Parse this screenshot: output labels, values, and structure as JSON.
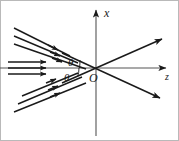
{
  "figure": {
    "kind": "optics-ray-diagram",
    "width": 179,
    "height": 141,
    "background_color": "#ffffff",
    "border_color": "#b9b9b9",
    "stroke_color": "#1a1a1a"
  },
  "axes": {
    "vertical": {
      "label": "x",
      "label_style": "italic",
      "direction": "up",
      "arrowhead": true,
      "x": 96,
      "y_top": 8,
      "y_bottom": 136
    },
    "horizontal": {
      "label": "z",
      "label_style": "italic",
      "direction": "right",
      "arrowhead": true,
      "y": 68,
      "x_left": 0,
      "x_right": 168
    },
    "origin": {
      "label": "O",
      "label_style": "italic",
      "x": 96,
      "y": 68
    }
  },
  "angles": [
    {
      "label": "θ",
      "name": "angle-of-incidence",
      "position": "above-axis-left-of-origin",
      "label_x": 68,
      "label_y": 65,
      "arc_from": "incident-ray-upper",
      "arc_to": "horizontal-axis"
    },
    {
      "label": "θ",
      "name": "angle-of-reflection",
      "position": "below-axis-left-of-origin",
      "label_x": 64,
      "label_y": 80,
      "arc_from": "horizontal-axis",
      "arc_to": "incident-ray-lower"
    }
  ],
  "ray_bundles": [
    {
      "name": "upper-left-incident-beam",
      "label": "",
      "direction": "down-right",
      "angle_deg": 27,
      "count": 3,
      "arrowheads": 3,
      "lines": [
        {
          "x1": 14,
          "y1": 28,
          "x2": 68,
          "y2": 55
        },
        {
          "x1": 14,
          "y1": 36,
          "x2": 76,
          "y2": 62
        },
        {
          "x1": 14,
          "y1": 44,
          "x2": 84,
          "y2": 68
        }
      ],
      "arrow_points": [
        {
          "x": 56,
          "y": 49,
          "angle_deg": 24
        },
        {
          "x": 58,
          "y": 55,
          "angle_deg": 24
        },
        {
          "x": 60,
          "y": 61,
          "angle_deg": 24
        }
      ]
    },
    {
      "name": "middle-left-horizontal-beam",
      "label": "",
      "direction": "right",
      "angle_deg": 0,
      "count": 3,
      "arrowheads": 3,
      "lines": [
        {
          "x1": 8,
          "y1": 62,
          "x2": 48,
          "y2": 62
        },
        {
          "x1": 8,
          "y1": 68,
          "x2": 48,
          "y2": 68
        },
        {
          "x1": 8,
          "y1": 74,
          "x2": 48,
          "y2": 74
        }
      ],
      "arrow_points": [
        {
          "x": 42,
          "y": 62,
          "angle_deg": 0
        },
        {
          "x": 42,
          "y": 68,
          "angle_deg": 0
        },
        {
          "x": 42,
          "y": 74,
          "angle_deg": 0
        }
      ]
    },
    {
      "name": "lower-left-incident-beam",
      "label": "",
      "direction": "up-right",
      "angle_deg": -27,
      "count": 3,
      "arrowheads": 3,
      "lines": [
        {
          "x1": 14,
          "y1": 112,
          "x2": 84,
          "y2": 82
        },
        {
          "x1": 18,
          "y1": 104,
          "x2": 80,
          "y2": 76
        },
        {
          "x1": 22,
          "y1": 96,
          "x2": 76,
          "y2": 72
        }
      ],
      "arrow_points": [
        {
          "x": 58,
          "y": 93,
          "angle_deg": -23
        },
        {
          "x": 56,
          "y": 86,
          "angle_deg": -23
        },
        {
          "x": 54,
          "y": 79,
          "angle_deg": -23
        }
      ]
    }
  ],
  "rays": [
    {
      "name": "outgoing-ray-upper-right",
      "direction": "up-right",
      "x1": 60,
      "y1": 83,
      "x2": 164,
      "y2": 37,
      "arrowhead": true
    },
    {
      "name": "outgoing-ray-lower-right",
      "direction": "down-right",
      "x1": 60,
      "y1": 53,
      "x2": 164,
      "y2": 100,
      "arrowhead": true
    }
  ]
}
